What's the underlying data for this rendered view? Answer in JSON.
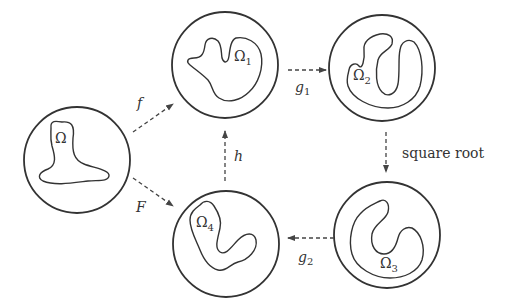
{
  "diagram": {
    "nodes": [
      {
        "id": "omega",
        "label": "Ω",
        "subscript": ""
      },
      {
        "id": "omega1",
        "label": "Ω",
        "subscript": "1"
      },
      {
        "id": "omega2",
        "label": "Ω",
        "subscript": "2"
      },
      {
        "id": "omega3",
        "label": "Ω",
        "subscript": "3"
      },
      {
        "id": "omega4",
        "label": "Ω",
        "subscript": "4"
      }
    ],
    "edges": [
      {
        "from": "omega",
        "to": "omega1",
        "label": "f",
        "subscript": ""
      },
      {
        "from": "omega",
        "to": "omega4",
        "label": "F",
        "subscript": ""
      },
      {
        "from": "omega1",
        "to": "omega2",
        "label": "g",
        "subscript": "1"
      },
      {
        "from": "omega2",
        "to": "omega3",
        "label": "square root",
        "subscript": ""
      },
      {
        "from": "omega3",
        "to": "omega4",
        "label": "g",
        "subscript": "2"
      },
      {
        "from": "omega4",
        "to": "omega1",
        "label": "h",
        "subscript": ""
      }
    ],
    "colors": {
      "stroke": "#333333",
      "background": "#ffffff"
    }
  }
}
